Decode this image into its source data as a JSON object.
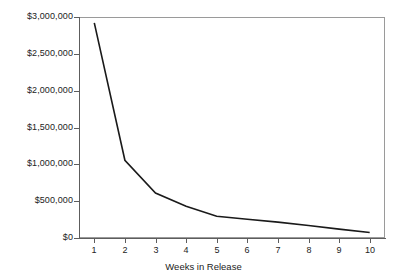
{
  "chart_data": {
    "type": "line",
    "title": "",
    "subtitle": "",
    "xlabel": "Weeks in Release",
    "ylabel": "",
    "categories": [
      1,
      2,
      3,
      4,
      5,
      6,
      7,
      8,
      9,
      10
    ],
    "x": [
      1,
      2,
      3,
      4,
      5,
      6,
      7,
      8,
      9,
      10
    ],
    "values": [
      2920000,
      1055000,
      610000,
      430000,
      295000,
      255000,
      215000,
      170000,
      120000,
      75000
    ],
    "series": [
      {
        "name": "Box office gross",
        "values": [
          2920000,
          1055000,
          610000,
          430000,
          295000,
          255000,
          215000,
          170000,
          120000,
          75000
        ]
      }
    ],
    "xlim": [
      0.5,
      10.5
    ],
    "ylim": [
      0,
      3000000
    ],
    "ytick_values": [
      0,
      500000,
      1000000,
      1500000,
      2000000,
      2500000,
      3000000
    ],
    "ytick_labels": [
      "$0",
      "$500,000",
      "$1,000,000",
      "$1,500,000",
      "$2,000,000",
      "$2,500,000",
      "$3,000,000"
    ],
    "xtick_labels": [
      "1",
      "2",
      "3",
      "4",
      "5",
      "6",
      "7",
      "8",
      "9",
      "10"
    ],
    "grid": false,
    "legend": "none",
    "line_color": "#1a1a1a",
    "axis_color": "#5d5d5d",
    "frame_color": "#9a9a9a",
    "background_color": "#ffffff",
    "markers": false,
    "annotations": []
  },
  "axis": {
    "x_title": "Weeks in Release"
  }
}
